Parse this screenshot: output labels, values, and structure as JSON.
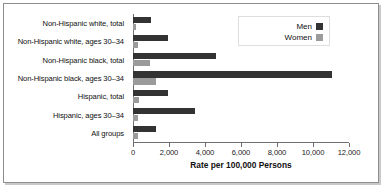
{
  "chart_data": {
    "type": "bar",
    "orientation": "horizontal",
    "title": "",
    "xlabel": "Rate per 100,000 Persons",
    "ylabel": "",
    "xlim": [
      0,
      12000
    ],
    "xticks": [
      0,
      2000,
      4000,
      6000,
      8000,
      10000,
      12000
    ],
    "xticklabels": [
      "0",
      "2,000",
      "4,000",
      "6,000",
      "8,000",
      "10,000",
      "12,000"
    ],
    "grid": false,
    "legend_position": "top-right",
    "categories": [
      "Non-Hispanic white, total",
      "Non-Hispanic white, ages 30–34",
      "Non-Hispanic black, total",
      "Non-Hispanic black, ages 30–34",
      "Hispanic, total",
      "Hispanic, ages 30–34",
      "All groups"
    ],
    "series": [
      {
        "name": "Men",
        "color": "#333333",
        "values": [
          1000,
          1950,
          4600,
          11050,
          1950,
          3450,
          1250
        ]
      },
      {
        "name": "Women",
        "color": "#9b9b9b",
        "values": [
          150,
          260,
          950,
          1300,
          340,
          300,
          260
        ]
      }
    ]
  },
  "legend": {
    "entries": [
      {
        "label": "Men",
        "color": "#333333"
      },
      {
        "label": "Women",
        "color": "#9b9b9b"
      }
    ]
  }
}
